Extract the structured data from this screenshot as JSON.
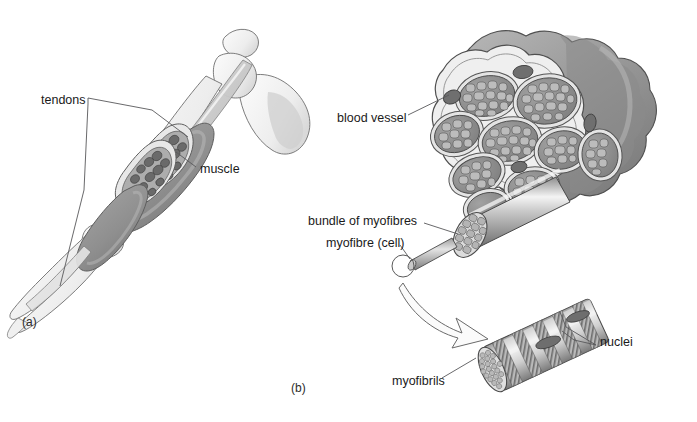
{
  "figure": {
    "background_color": "#ffffff",
    "width": 697,
    "height": 422
  },
  "panels": [
    {
      "id": "a",
      "tag": "(a)",
      "caption": "Arm showing muscle and tendons",
      "x": 22,
      "y": 316
    },
    {
      "id": "b",
      "tag": "(b)",
      "caption": "Cross-section through a muscle",
      "x": 291,
      "y": 382
    }
  ],
  "labels": [
    {
      "name": "tendons",
      "text": "tendons",
      "x": 41,
      "y": 100,
      "panel": "a"
    },
    {
      "name": "muscle",
      "text": "muscle",
      "x": 200,
      "y": 170,
      "panel": "a"
    },
    {
      "name": "blood-vessel",
      "text": "blood vessel",
      "x": 337,
      "y": 118,
      "panel": "b"
    },
    {
      "name": "bundle-of-myofibres",
      "text": "bundle of myofibres",
      "x": 308,
      "y": 221,
      "panel": "b"
    },
    {
      "name": "myofibre-cell",
      "text": "myofibre (cell)",
      "x": 326,
      "y": 243,
      "panel": "b"
    },
    {
      "name": "myofibrils",
      "text": "myofibrils",
      "x": 395,
      "y": 382,
      "panel": "b"
    },
    {
      "name": "nuclei",
      "text": "nuclei",
      "x": 600,
      "y": 342,
      "panel": "b"
    }
  ],
  "colors": {
    "outline": "#4a4a4a",
    "thin_outline": "#6e6e6e",
    "leader_line": "#58585a",
    "muscle_fill": "#9a9a9a",
    "muscle_fill_dark": "#7e7e7e",
    "muscle_fill_light": "#b6b6b6",
    "bone_fill": "#f2f2f2",
    "bone_shade": "#dcdcdc",
    "tendon_fill": "#e6e6e6",
    "sheath_fill": "#efefef",
    "fascicle_fill": "#8c8c8c",
    "myofibre_cell_fill": "#b4b4b4",
    "blood_vessel_fill": "#6f6f6f",
    "cylinder_light": "#eaeaea",
    "cylinder_mid": "#a8a8a8",
    "cylinder_dark": "#6b6b6b",
    "striation_dark": "#7a7a7a",
    "striation_light": "#dddddd",
    "arrow_fill": "#fbfbfb",
    "text": "#1a1a1a"
  },
  "structures": {
    "panel_a": {
      "name": "arm-diagram",
      "parts": [
        "scapula",
        "humerus",
        "radius",
        "ulna",
        "biceps-muscle",
        "upper-tendon",
        "lower-tendon",
        "muscle-cut-section"
      ],
      "cut_section_fascicle_count": 18
    },
    "panel_b": {
      "name": "muscle-cross-section",
      "fascicle_count": 9,
      "blood_vessel_count": 3,
      "myofibre_cylinder": {
        "name": "bundle-of-myofibres-cylinder",
        "cells_visible": 22
      },
      "single_myofibre": {
        "name": "single-myofibre-stalk"
      },
      "magnifier_circle": {
        "name": "myofibre-callout-circle",
        "cx": 403,
        "cy": 266,
        "r": 11
      },
      "zoom_arrow": {
        "name": "magnification-arrow"
      },
      "myofibril_cylinder": {
        "name": "myofibril-cylinder",
        "striation_band_count": 9,
        "nuclei_count": 2
      }
    }
  }
}
